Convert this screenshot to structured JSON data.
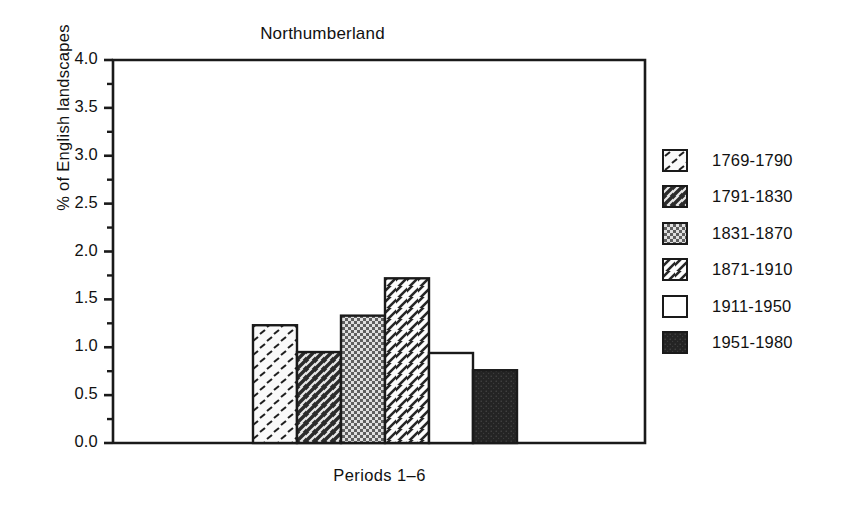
{
  "chart_data": {
    "type": "bar",
    "title": "Northumberland",
    "xlabel": "Periods 1–6",
    "ylabel": "% of English landscapes",
    "categories": [
      "1769-1790",
      "1791-1830",
      "1831-1870",
      "1871-1910",
      "1911-1950",
      "1951-1980"
    ],
    "values": [
      1.23,
      0.95,
      1.33,
      1.72,
      0.94,
      0.76
    ],
    "ylim": [
      0.0,
      4.0
    ],
    "ytick_labels": [
      "0.0",
      "0.5",
      "1.0",
      "1.5",
      "2.0",
      "2.5",
      "3.0",
      "3.5",
      "4.0"
    ],
    "ytick_values": [
      0.0,
      0.5,
      1.0,
      1.5,
      2.0,
      2.5,
      3.0,
      3.5,
      4.0
    ],
    "minor_tick_step": 0.25,
    "grid": false,
    "legend_position": "right",
    "legend": [
      {
        "label": "1769-1790",
        "pattern": "sparse-dash-light"
      },
      {
        "label": "1791-1830",
        "pattern": "dark-diagonal-stripe"
      },
      {
        "label": "1831-1870",
        "pattern": "dotted-checker"
      },
      {
        "label": "1871-1910",
        "pattern": "diagonal-hatch-white"
      },
      {
        "label": "1911-1950",
        "pattern": "solid-white"
      },
      {
        "label": "1951-1980",
        "pattern": "solid-dark"
      }
    ],
    "colors": {
      "axis": "#1a1a1a",
      "bar_outline": "#1a1a1a",
      "dark_fill": "#2b2b2b",
      "light_fill": "#f7f7f7",
      "mid_fill": "#6e6e6e"
    }
  }
}
